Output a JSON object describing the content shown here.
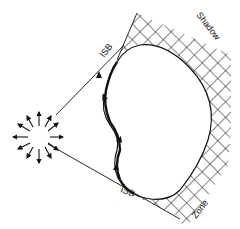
{
  "diagram": {
    "type": "scattering-shadow-diagram",
    "labels": {
      "isb_top": "ISB",
      "isb_bottom": "ISB",
      "shadow": "Shadow",
      "zone": "Zone"
    },
    "elements": {
      "source": "point-source-radiating-arrows",
      "object": "convex-scatterer",
      "tangent_rays": 2,
      "shadow_region": "cross-hatched"
    },
    "colors": {
      "ink": "#111111",
      "background": "#ffffff"
    }
  }
}
